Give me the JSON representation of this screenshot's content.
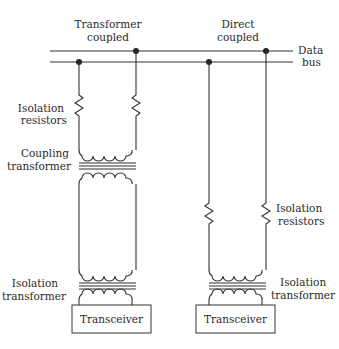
{
  "diagram": {
    "bus_label": [
      "Data",
      "bus"
    ],
    "sections": [
      {
        "title": [
          "Transformer",
          "coupled"
        ],
        "labels": {
          "isolation_resistors": [
            "Isolation",
            "resistors"
          ],
          "coupling_transformer": [
            "Coupling",
            "transformer"
          ],
          "isolation_transformer": [
            "Isolation",
            "transformer"
          ]
        },
        "transceiver": "Transceiver"
      },
      {
        "title": [
          "Direct",
          "coupled"
        ],
        "labels": {
          "isolation_resistors": [
            "Isolation",
            "resistors"
          ],
          "isolation_transformer": [
            "Isolation",
            "transformer"
          ]
        },
        "transceiver": "Transceiver"
      }
    ]
  }
}
